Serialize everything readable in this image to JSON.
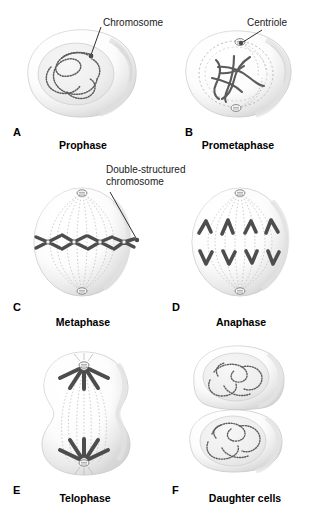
{
  "figure": {
    "background_color": "#ffffff",
    "ink_color": "#3a3a3a",
    "chromosome_color": "#4a4a4a",
    "spindle_color": "#9a9a9a",
    "cell_fill": "#f4f4f4"
  },
  "annotations": [
    {
      "id": "chromosome",
      "text": "Chromosome"
    },
    {
      "id": "centriole",
      "text": "Centriole"
    },
    {
      "id": "double_structured_line1",
      "text": "Double-structured"
    },
    {
      "id": "double_structured_line2",
      "text": "chromosome"
    }
  ],
  "panels": [
    {
      "letter": "A",
      "caption": "Prophase",
      "description": "Round cell with intact nucleus containing long beaded chromatin threads",
      "chromosome_count": 4,
      "nucleus_visible": true,
      "spindle_visible": false,
      "centrioles_visible": false
    },
    {
      "letter": "B",
      "caption": "Prometaphase",
      "description": "Nuclear envelope breaking down, condensed tangled chromosomes, two centrioles at poles",
      "chromosome_count": 4,
      "nucleus_visible": false,
      "spindle_visible": true,
      "centrioles_visible": true
    },
    {
      "letter": "C",
      "caption": "Metaphase",
      "description": "Oval cell, double-structured X-shaped chromosomes aligned on the equatorial plate, full spindle",
      "chromosome_count": 4,
      "nucleus_visible": false,
      "spindle_visible": true,
      "centrioles_visible": true
    },
    {
      "letter": "D",
      "caption": "Anaphase",
      "description": "Sister chromatids separated as V shapes migrating toward opposite poles",
      "chromosome_count": 8,
      "nucleus_visible": false,
      "spindle_visible": true,
      "centrioles_visible": true
    },
    {
      "letter": "E",
      "caption": "Telophase",
      "description": "Elongated cell with cleavage furrow, chromosome clusters fanning from each pole",
      "chromosome_count": 8,
      "nucleus_visible": false,
      "spindle_visible": true,
      "centrioles_visible": true
    },
    {
      "letter": "F",
      "caption": "Daughter cells",
      "description": "Two separated daughter cells each with a nucleus of decondensed beaded chromatin",
      "chromosome_count": 4,
      "nucleus_visible": true,
      "spindle_visible": false,
      "centrioles_visible": false
    }
  ]
}
